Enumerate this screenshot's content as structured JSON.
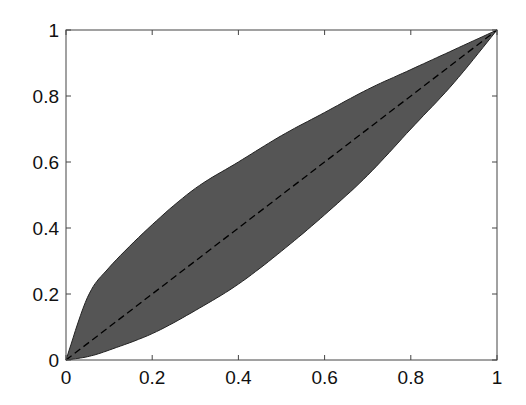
{
  "chart_data": {
    "type": "area",
    "title": "",
    "xlabel": "",
    "ylabel": "",
    "xlim": [
      0,
      1
    ],
    "ylim": [
      0,
      1
    ],
    "grid": false,
    "x_ticks": [
      "0",
      "0.2",
      "0.4",
      "0.6",
      "0.8",
      "1"
    ],
    "y_ticks": [
      "0",
      "0.2",
      "0.4",
      "0.6",
      "0.8",
      "1"
    ],
    "series": [
      {
        "name": "upper bound",
        "style": "solid boundary of shaded region",
        "x": [
          0,
          0.05,
          0.1,
          0.2,
          0.3,
          0.4,
          0.5,
          0.6,
          0.7,
          0.8,
          0.9,
          1.0
        ],
        "values": [
          0,
          0.19,
          0.28,
          0.41,
          0.52,
          0.6,
          0.68,
          0.75,
          0.82,
          0.88,
          0.94,
          1.0
        ]
      },
      {
        "name": "lower bound",
        "style": "solid boundary of shaded region",
        "x": [
          0,
          0.05,
          0.1,
          0.2,
          0.3,
          0.4,
          0.5,
          0.6,
          0.7,
          0.8,
          0.9,
          1.0
        ],
        "values": [
          0,
          0.01,
          0.03,
          0.08,
          0.15,
          0.23,
          0.33,
          0.44,
          0.56,
          0.7,
          0.84,
          1.0
        ]
      },
      {
        "name": "diagonal",
        "style": "dashed black line",
        "x": [
          0,
          1
        ],
        "values": [
          0,
          1
        ]
      }
    ],
    "fill_color": "#555555",
    "plot_area_px": {
      "left": 66,
      "right": 497,
      "top": 30,
      "bottom": 360
    }
  }
}
